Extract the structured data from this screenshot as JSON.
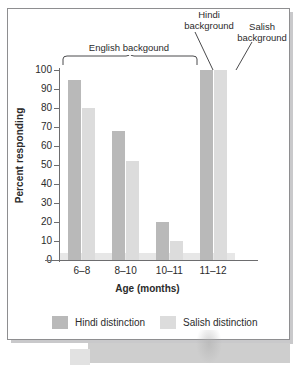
{
  "chart_data": {
    "type": "bar",
    "title": "",
    "xlabel": "Age (months)",
    "ylabel": "Percent responding",
    "ylim": [
      0,
      100
    ],
    "yticks": [
      0,
      10,
      20,
      30,
      40,
      50,
      60,
      70,
      80,
      90,
      100
    ],
    "ytick_labels": [
      "0",
      "10",
      "20",
      "30",
      "40",
      "50",
      "60",
      "70",
      "80",
      "90",
      "100"
    ],
    "grid": false,
    "legend_position": "bottom",
    "categories": [
      "6–8",
      "8–10",
      "10–11",
      "11–12"
    ],
    "series": [
      {
        "name": "Hindi distinction",
        "color": "#b9b9b9",
        "values": [
          95,
          68,
          20,
          100
        ]
      },
      {
        "name": "Salish distinction",
        "color": "#dcdcdc",
        "values": [
          80,
          52,
          10,
          100
        ]
      }
    ],
    "annotations": [
      {
        "id": "english-background",
        "text": "English backgound",
        "covers": [
          "6–8",
          "8–10",
          "10–11"
        ],
        "marker": "brace"
      },
      {
        "id": "hindi-background",
        "text": "Hindi\nbackground",
        "covers": [
          "11–12"
        ],
        "marker": "leader-line"
      },
      {
        "id": "salish-background",
        "text": "Salish\nbackground",
        "covers": [
          "11–12"
        ],
        "marker": "leader-line"
      }
    ]
  },
  "axes": {
    "y_title": "Percent responding",
    "x_title": "Age (months)",
    "y_tick_labels": [
      "100",
      "90",
      "80",
      "70",
      "60",
      "50",
      "40",
      "30",
      "20",
      "10",
      "0"
    ],
    "x_tick_labels": [
      "6–8",
      "8–10",
      "10–11",
      "11–12"
    ]
  },
  "annotations": {
    "english": "English backgound",
    "hindi_line1": "Hindi",
    "hindi_line2": "background",
    "salish_line1": "Salish",
    "salish_line2": "background"
  },
  "legend": {
    "items": [
      {
        "label": "Hindi distinction",
        "color": "#b9b9b9"
      },
      {
        "label": "Salish distinction",
        "color": "#dcdcdc"
      }
    ]
  },
  "colors": {
    "hindi_bar": "#b9b9b9",
    "salish_bar": "#dcdcdc",
    "axis": "#6d6d6f",
    "text": "#2b2b2b",
    "frame": "#8e8e90",
    "page_background": "#ffffff"
  }
}
